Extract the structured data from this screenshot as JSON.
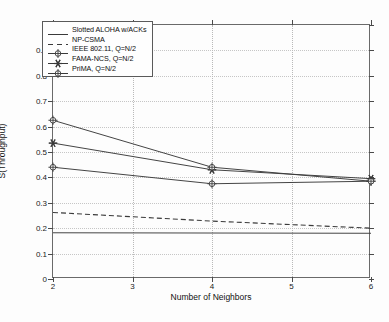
{
  "chart_data": {
    "type": "line",
    "title": "",
    "xlabel": "Number of Neighbors",
    "ylabel": "S(Throughput)",
    "xlim": [
      2,
      6
    ],
    "ylim": [
      0,
      1
    ],
    "grid": true,
    "legend_position": "top-left",
    "x_ticks": [
      "2",
      "3",
      "4",
      "5",
      "6"
    ],
    "y_ticks": [
      "0",
      "0.1",
      "0.2",
      "0.3",
      "0.4",
      "0.5",
      "0.6",
      "0.7",
      "0.8",
      "0.9",
      "1"
    ],
    "x": [
      2,
      4,
      6
    ],
    "series": [
      {
        "name": "Slotted ALOHA w/ACKs",
        "marker": "none",
        "style": "solid",
        "color": "#3a3a3a",
        "values": [
          0.182,
          0.181,
          0.18
        ]
      },
      {
        "name": "NP-CSMA",
        "marker": "none",
        "style": "dashed",
        "color": "#3a3a3a",
        "values": [
          0.262,
          0.228,
          0.2
        ]
      },
      {
        "name": "IEEE 802.11, Q=N/2",
        "marker": "circle-cross",
        "style": "solid",
        "color": "#3a3a3a",
        "values": [
          0.44,
          0.375,
          0.385
        ]
      },
      {
        "name": "FAMA-NCS, Q=N/2",
        "marker": "star",
        "style": "solid",
        "color": "#3a3a3a",
        "values": [
          0.535,
          0.43,
          0.395
        ]
      },
      {
        "name": "PriMA, Q=N/2",
        "marker": "circle-cross",
        "style": "solid",
        "color": "#3a3a3a",
        "values": [
          0.625,
          0.44,
          0.385
        ]
      }
    ]
  }
}
